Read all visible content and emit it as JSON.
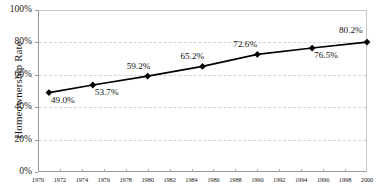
{
  "chart_data": {
    "type": "line",
    "title": "",
    "xlabel": "",
    "ylabel": "Homeownership Rate",
    "x": [
      1971,
      1975,
      1980,
      1985,
      1990,
      1995,
      2000
    ],
    "values": [
      49.0,
      53.7,
      59.2,
      65.2,
      72.6,
      76.5,
      80.2
    ],
    "point_labels": [
      "49.0%",
      "53.7%",
      "59.2%",
      "65.2%",
      "72.6%",
      "76.5%",
      "80.2%"
    ],
    "xlim": [
      1970,
      2000
    ],
    "ylim": [
      0,
      100
    ],
    "yticks": [
      0,
      20,
      40,
      60,
      80,
      100
    ],
    "ytick_labels": [
      "0%",
      "20%",
      "40%",
      "60%",
      "80%",
      "100%"
    ],
    "xticks": [
      1970,
      1972,
      1974,
      1976,
      1978,
      1980,
      1982,
      1984,
      1986,
      1988,
      1990,
      1992,
      1994,
      1996,
      1998,
      2000
    ],
    "xtick_labels": [
      "1970",
      "1972",
      "1974",
      "1976",
      "1978",
      "1980",
      "1982",
      "1984",
      "1986",
      "1988",
      "1990",
      "1992",
      "1994",
      "1996",
      "1998",
      "2000"
    ],
    "grid": true,
    "legend": false,
    "marker": "diamond",
    "line_color": "#000000",
    "marker_color": "#000000",
    "grid_color": "#d2d2d2",
    "axis_color": "#9a9a9a",
    "background": "#ffffff"
  }
}
